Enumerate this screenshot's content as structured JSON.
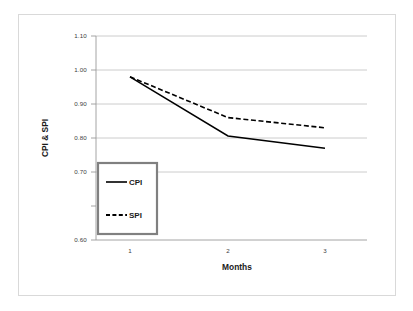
{
  "chart_data": {
    "type": "line",
    "title": "",
    "xlabel": "Months",
    "ylabel": "CPI & SPI",
    "categories": [
      "1",
      "2",
      "3"
    ],
    "x": [
      1,
      2,
      3
    ],
    "series": [
      {
        "name": "CPI",
        "style": "solid",
        "color": "#000000",
        "values": [
          1.0,
          0.855,
          0.825
        ]
      },
      {
        "name": "SPI",
        "style": "dashed",
        "color": "#000000",
        "values": [
          1.0,
          0.9,
          0.875
        ]
      }
    ],
    "ylim": [
      0.6,
      1.1
    ],
    "yticks": [
      "0.60",
      "0.70",
      "0.80",
      "0.90",
      "1.00",
      "1.10"
    ],
    "ytick_values": [
      0.6,
      0.7,
      0.8,
      0.9,
      1.0,
      1.1
    ],
    "xticks": [
      "1",
      "2",
      "3"
    ],
    "grid": "horizontal",
    "legend_position": "inside-lower-left",
    "legend_entries": [
      "CPI",
      "SPI"
    ],
    "background_color": "#ffffff",
    "gridline_color": "#bfbfbf",
    "frame_color": "#d9d9d9"
  },
  "axes": {
    "y_title": "CPI & SPI",
    "x_title": "Months",
    "y_tick_labels": [
      "1.10",
      "1.00",
      "0.90",
      "0.80",
      "0.70",
      "0.60"
    ],
    "x_tick_labels": [
      "1",
      "2",
      "3"
    ]
  },
  "legend": {
    "items": [
      {
        "label": "CPI",
        "style": "solid"
      },
      {
        "label": "SPI",
        "style": "dashed"
      }
    ]
  }
}
